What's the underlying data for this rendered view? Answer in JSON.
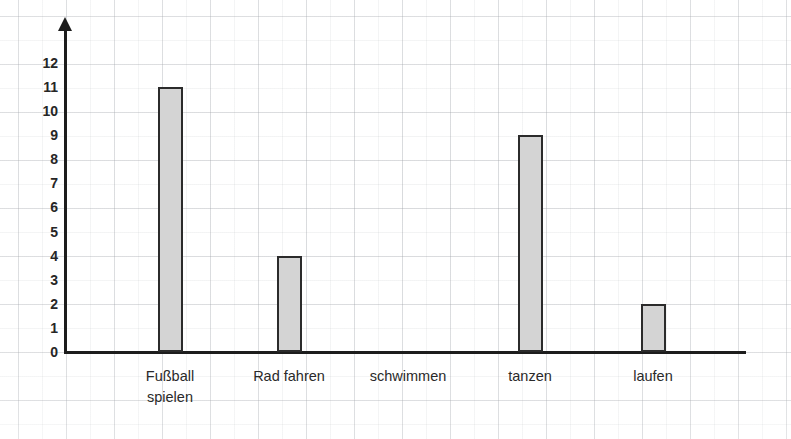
{
  "chart_data": {
    "type": "bar",
    "title": "",
    "subtitle": "",
    "xlabel": "",
    "ylabel": "",
    "categories": [
      "Fußball\nspielen",
      "Rad fahren",
      "schwimmen",
      "tanzen",
      "laufen"
    ],
    "category_labels_flat": [
      "Fußball spielen",
      "Rad fahren",
      "schwimmen",
      "tanzen",
      "laufen"
    ],
    "values": [
      11,
      4,
      0,
      9,
      2
    ],
    "ylim": [
      0,
      12
    ],
    "ytick_labels": [
      "12",
      "11",
      "10",
      "9",
      "8",
      "7",
      "6",
      "5",
      "4",
      "3",
      "2",
      "1",
      "0"
    ],
    "ytick_values": [
      12,
      11,
      10,
      9,
      8,
      7,
      6,
      5,
      4,
      3,
      2,
      1,
      0
    ],
    "grid": true,
    "grid_style": "graph-paper",
    "legend": "none",
    "bar_fill_color": "#d4d4d4",
    "bar_border_color": "#2b2b2b",
    "axis_color": "#1d1d1d",
    "background_color": "#ffffff"
  },
  "axes": {
    "y_axis_name": "value-axis",
    "x_axis_name": "category-axis",
    "y_arrow": true,
    "x_arrow": false
  }
}
